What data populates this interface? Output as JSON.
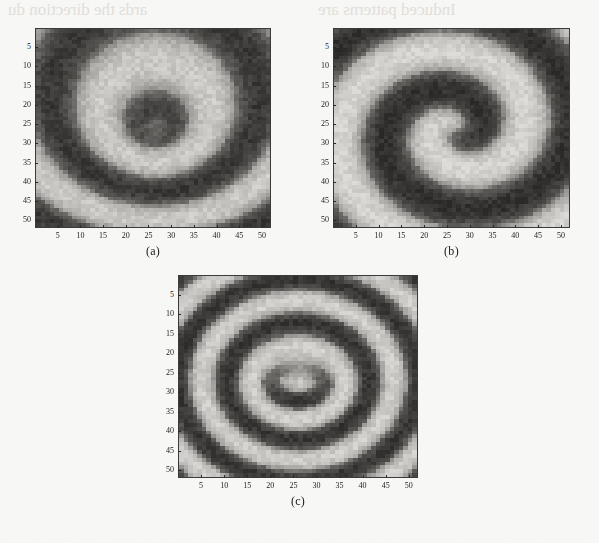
{
  "figure": {
    "background_color": "#f7f7f5",
    "width": 599,
    "height": 543,
    "ghost_text_left": "ards the direction du",
    "ghost_text_right": "Induced patterns are"
  },
  "axes": {
    "x_ticks": [
      5,
      10,
      15,
      20,
      25,
      30,
      35,
      40,
      45,
      50
    ],
    "y_ticks": [
      5,
      10,
      15,
      20,
      25,
      30,
      35,
      40,
      45,
      50
    ],
    "x_range": [
      0,
      52
    ],
    "y_range": [
      0,
      52
    ],
    "tick_color": "#2b2927",
    "label_color": "#23211f"
  },
  "panels": [
    {
      "id": "panel-a",
      "caption": "(a)",
      "description": "circular concentric interference fringes with offset core",
      "left": 35,
      "top": 28,
      "width": 236,
      "height": 200,
      "x_ticks": [
        5,
        10,
        15,
        20,
        25,
        30,
        35,
        40,
        45,
        50
      ],
      "y_ticks": [
        5,
        10,
        15,
        20,
        25,
        30,
        35,
        40,
        45,
        50
      ],
      "pattern": {
        "type": "concentric",
        "charge": 0,
        "grid": 52,
        "centers": [
          {
            "x": 26.5,
            "y": 26.0,
            "charge": 0
          }
        ],
        "radial_frequency": 0.62,
        "phase_offset": 0.0,
        "tilt_x": 0.0,
        "tilt_y": 0.1,
        "contrast": 0.86,
        "noise": 0.16,
        "dark_color": "#2e2c2a",
        "light_color": "#d8d6d2"
      }
    },
    {
      "id": "panel-b",
      "caption": "(b)",
      "description": "single-arm spiral fringe pattern, topological charge 1",
      "left": 333,
      "top": 28,
      "width": 237,
      "height": 200,
      "x_ticks": [
        5,
        10,
        15,
        20,
        25,
        30,
        35,
        40,
        45,
        50
      ],
      "y_ticks": [
        5,
        10,
        15,
        20,
        25,
        30,
        35,
        40,
        45,
        50
      ],
      "pattern": {
        "type": "spiral",
        "charge": 1,
        "grid": 52,
        "centers": [
          {
            "x": 27.0,
            "y": 26.5,
            "charge": 1
          }
        ],
        "radial_frequency": 0.6,
        "phase_offset": 1.7,
        "tilt_x": 0.0,
        "tilt_y": 0.0,
        "contrast": 0.92,
        "noise": 0.14,
        "dark_color": "#2a2826",
        "light_color": "#dedcd8"
      }
    },
    {
      "id": "panel-c",
      "caption": "(c)",
      "description": "vortex dipole, two opposite-charge cores side by side",
      "left": 178,
      "top": 275,
      "width": 240,
      "height": 203,
      "x_ticks": [
        5,
        10,
        15,
        20,
        25,
        30,
        35,
        40,
        45,
        50
      ],
      "y_ticks": [
        5,
        10,
        15,
        20,
        25,
        30,
        35,
        40,
        45,
        50
      ],
      "pattern": {
        "type": "dipole",
        "charge": 0,
        "grid": 52,
        "centers": [
          {
            "x": 22.5,
            "y": 26.5,
            "charge": 1
          },
          {
            "x": 29.5,
            "y": 26.5,
            "charge": -1
          }
        ],
        "radial_frequency": 0.58,
        "phase_offset": 0.4,
        "tilt_x": 0.0,
        "tilt_y": 0.0,
        "contrast": 0.88,
        "noise": 0.15,
        "dark_color": "#2c2a28",
        "light_color": "#dbd9d5"
      }
    }
  ]
}
